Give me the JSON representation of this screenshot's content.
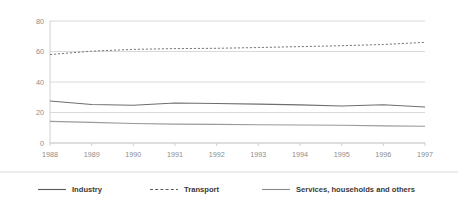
{
  "chart_data": {
    "type": "line",
    "title": "",
    "subtitle": "",
    "xlabel": "",
    "ylabel": "",
    "categories": [
      1988,
      1989,
      1990,
      1991,
      1992,
      1993,
      1994,
      1995,
      1996,
      1997
    ],
    "x_tick_labels": [
      "1988",
      "1989",
      "1990",
      "1991",
      "1992",
      "1993",
      "1994",
      "1995",
      "1996",
      "1997"
    ],
    "y_tick_labels": [
      "0",
      "20",
      "40",
      "60",
      "80"
    ],
    "y_ticks": [
      0,
      20,
      40,
      60,
      80
    ],
    "ylim": [
      0,
      80
    ],
    "grid": "horizontal",
    "legend_position": "bottom",
    "series": [
      {
        "name": "Industry",
        "style": "solid",
        "color": "#6e6e6e",
        "values": [
          27.5,
          25.2,
          24.8,
          26.2,
          25.9,
          25.5,
          25.0,
          24.3,
          25.1,
          23.6
        ]
      },
      {
        "name": "Transport",
        "style": "dashed",
        "color": "#7a7a7a",
        "values": [
          58.0,
          60.2,
          61.4,
          61.9,
          62.1,
          62.6,
          63.2,
          63.8,
          64.6,
          66.0
        ]
      },
      {
        "name": "Services, households and others",
        "style": "solid",
        "color": "#9a9a9a",
        "values": [
          14.2,
          13.5,
          12.8,
          12.4,
          12.2,
          12.0,
          11.8,
          11.6,
          11.2,
          11.0
        ]
      }
    ]
  },
  "axes": {
    "y_tick_labels": [
      "80",
      "60",
      "40",
      "20",
      "0"
    ],
    "x_tick_labels": [
      "1988",
      "1989",
      "1990",
      "1991",
      "1992",
      "1993",
      "1994",
      "1995",
      "1996",
      "1997"
    ]
  },
  "legend": {
    "items": [
      {
        "label": "Industry",
        "style": "solid",
        "color": "#5a5a5a"
      },
      {
        "label": "Transport",
        "style": "dashed",
        "color": "#5a5a5a"
      },
      {
        "label": "Services, households and others",
        "style": "solid",
        "color": "#8a8a8a"
      }
    ]
  },
  "colors": {
    "background": "#ffffff",
    "gridline": "#d9d9d9",
    "axis": "#d0d0d0",
    "tick_text": "#8c8c8c",
    "legend_text": "#3a3a3a",
    "legend_divider": "#d9d9d9"
  }
}
